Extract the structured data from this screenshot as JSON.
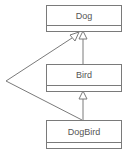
{
  "diagram": {
    "type": "uml-class-diagram",
    "classes": [
      {
        "id": "dog",
        "name": "Dog"
      },
      {
        "id": "bird",
        "name": "Bird"
      },
      {
        "id": "dogbird",
        "name": "DogBird"
      }
    ],
    "relations": [
      {
        "from": "Bird",
        "to": "Dog",
        "kind": "generalization"
      },
      {
        "from": "DogBird",
        "to": "Bird",
        "kind": "generalization"
      },
      {
        "from": "DogBird",
        "to": "Dog",
        "kind": "generalization"
      }
    ],
    "colors": {
      "line": "#7a7a7a",
      "text": "#555555",
      "background": "#ffffff"
    }
  }
}
